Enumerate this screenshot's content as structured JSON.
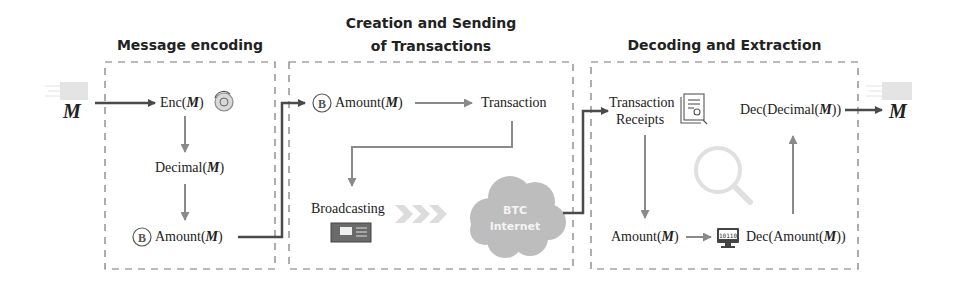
{
  "colors": {
    "arrow_dark": "#4a4a4a",
    "arrow_gray": "#8a8a8a",
    "dashed_border": "#777777",
    "cloud": "#bdbdbd",
    "chevron": "#dcdcdc",
    "magnifier": "#dddddd"
  },
  "input": {
    "symbol": "M"
  },
  "output": {
    "symbol": "M"
  },
  "stages": [
    {
      "title": "Message encoding",
      "nodes": [
        {
          "label_pre": "Enc(",
          "var": "M",
          "label_post": ")",
          "icon": "encryption-icon"
        },
        {
          "label_pre": "Decimal(",
          "var": "M",
          "label_post": ")"
        },
        {
          "label_pre": "Amount(",
          "var": "M",
          "label_post": ")",
          "icon": "bitcoin-coin-icon"
        }
      ]
    },
    {
      "title_line1": "Creation and Sending",
      "title_line2": "of Transactions",
      "nodes": [
        {
          "label_pre": "Amount(",
          "var": "M",
          "label_post": ")",
          "icon": "bitcoin-coin-icon"
        },
        {
          "label": "Transaction"
        },
        {
          "label": "Broadcasting",
          "icon": "network-switch-icon"
        },
        {
          "cloud_line1": "BTC",
          "cloud_line2": "Internet"
        }
      ]
    },
    {
      "title": "Decoding and Extraction",
      "nodes": [
        {
          "label_line1": "Transaction",
          "label_line2": "Receipts",
          "icon": "receipt-document-icon"
        },
        {
          "label_pre": "Amount(",
          "var": "M",
          "label_post": ")"
        },
        {
          "label_pre": "Dec(Amount(",
          "var": "M",
          "label_post": "))",
          "icon": "binary-monitor-icon"
        },
        {
          "label_pre": "Dec(Decimal(",
          "var": "M",
          "label_post": "))"
        }
      ]
    }
  ]
}
